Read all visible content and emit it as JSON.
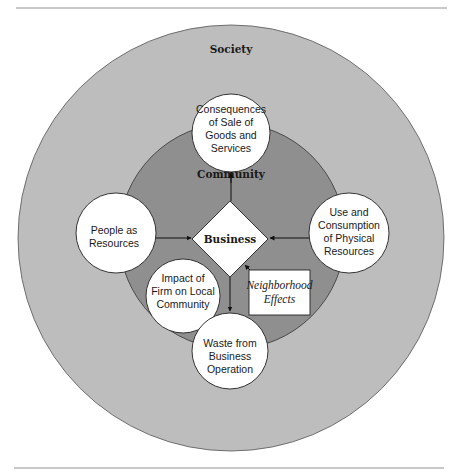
{
  "diagram": {
    "type": "nested-circle concept diagram",
    "outer_ring": {
      "label": "Society",
      "color": "#bdbdbd"
    },
    "inner_ring": {
      "label": "Community",
      "color": "#8f8f8f"
    },
    "center": {
      "label": "Business",
      "shape": "diamond"
    },
    "nodes": [
      {
        "id": "consequences",
        "lines": [
          "Consequences",
          "of Sale of",
          "Goods and",
          "Services"
        ]
      },
      {
        "id": "people",
        "lines": [
          "People as",
          "Resources"
        ]
      },
      {
        "id": "use",
        "lines": [
          "Use and",
          "Consumption",
          "of Physical",
          "Resources"
        ]
      },
      {
        "id": "impact",
        "lines": [
          "Impact of",
          "Firm on Local",
          "Community"
        ]
      },
      {
        "id": "waste",
        "lines": [
          "Waste from",
          "Business",
          "Operation"
        ]
      }
    ],
    "box": {
      "lines": [
        "Neighborhood",
        "Effects"
      ]
    },
    "edges": [
      {
        "from": "Business",
        "to": "Consequences of Sale of Goods and Services"
      },
      {
        "from": "People as Resources",
        "to": "Business"
      },
      {
        "from": "Use and Consumption of Physical Resources",
        "to": "Business"
      },
      {
        "from": "Business",
        "to": "Waste from Business Operation"
      },
      {
        "from": "Business",
        "to": "Neighborhood Effects",
        "bidirectional": true
      }
    ]
  }
}
